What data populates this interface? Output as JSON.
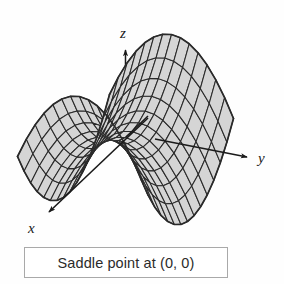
{
  "figure": {
    "title": "",
    "caption": "Saddle point at (0, 0)",
    "background_color": "#fefefe",
    "surface_fill_color": "#d5d5d5",
    "mesh_line_color": "#2a2a2a",
    "axis_color": "#1a1a1a",
    "caption_border_color": "#a9a9a9",
    "caption_text_color": "#2b2b2b"
  },
  "axes": {
    "x_label": "x",
    "y_label": "y",
    "z_label": "z"
  },
  "chart_data": {
    "type": "surface",
    "title": "Saddle point at (0, 0)",
    "function": "z = x^2 - y^2",
    "xlabel": "x",
    "ylabel": "y",
    "zlabel": "z",
    "xlim": [
      -1,
      1
    ],
    "ylim": [
      -1,
      1
    ],
    "zlim": [
      -1,
      1
    ],
    "grid": true,
    "legend": "none",
    "critical_point": {
      "x": 0,
      "y": 0,
      "z": 0,
      "kind": "saddle point"
    },
    "mesh_u_steps": 14,
    "mesh_v_steps": 14,
    "annotations": [
      "Saddle point at (0, 0)"
    ]
  }
}
